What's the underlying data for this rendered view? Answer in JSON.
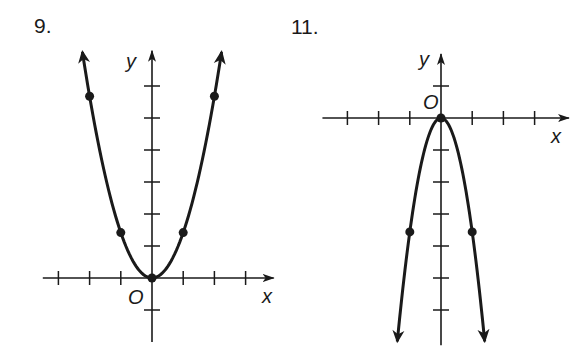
{
  "chart_data": [
    {
      "type": "line",
      "problem_label": "9.",
      "title": "",
      "xlabel": "x",
      "ylabel": "y",
      "origin_label": "O",
      "grid": false,
      "x_ticks": [
        -3,
        -2,
        -1,
        1,
        2,
        3
      ],
      "y_ticks": [
        -1,
        1,
        2,
        3,
        4,
        5,
        6
      ],
      "xlim": [
        -3.5,
        3.9
      ],
      "ylim": [
        -2,
        7.1
      ],
      "curve": "parabola opening upward, vertex at origin",
      "points": [
        {
          "x": -2,
          "y": 5.6
        },
        {
          "x": -1,
          "y": 1.4
        },
        {
          "x": 0,
          "y": 0
        },
        {
          "x": 1,
          "y": 1.4
        },
        {
          "x": 2,
          "y": 5.6
        }
      ],
      "coefficient": 1.42,
      "x_range": [
        -2.23,
        2.23
      ]
    },
    {
      "type": "line",
      "problem_label": "11.",
      "title": "",
      "xlabel": "x",
      "ylabel": "y",
      "origin_label": "O",
      "grid": false,
      "x_ticks": [
        -3,
        -2,
        -1,
        1,
        2,
        3
      ],
      "y_ticks": [
        1,
        -1,
        -2,
        -3,
        -4,
        -5,
        -6
      ],
      "xlim": [
        -3.8,
        4.1
      ],
      "ylim": [
        -7.1,
        2
      ],
      "curve": "parabola opening downward, vertex at origin",
      "points": [
        {
          "x": -1,
          "y": -3.6
        },
        {
          "x": 0,
          "y": 0
        },
        {
          "x": 1,
          "y": -3.6
        }
      ],
      "coefficient": -3.56,
      "x_range": [
        -1.4,
        1.4
      ]
    }
  ],
  "style": {
    "ink": "#1a1a1a",
    "paper": "#ffffff"
  }
}
